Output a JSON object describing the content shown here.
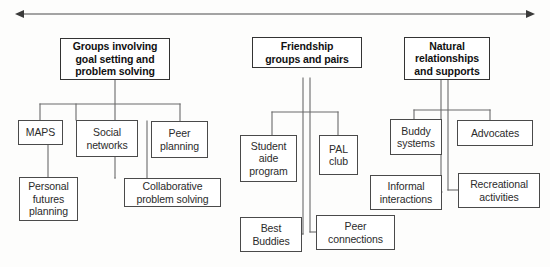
{
  "diagram": {
    "type": "hierarchy-chart",
    "title_arrow": {
      "name": "continuum-arrow",
      "direction": "double-headed",
      "description": "horizontal double-headed arrow spanning the top of the diagram"
    },
    "colors": {
      "background": "#fdfdfc",
      "box_border": "#4a4a4a",
      "heading_border": "#333333",
      "connector": "#6a6a6a",
      "text": "#1a1a1a"
    },
    "groups": [
      {
        "id": "group-goal-setting",
        "heading": "Groups involving\ngoal setting and\nproblem solving",
        "children": [
          {
            "id": "maps",
            "label": "MAPS"
          },
          {
            "id": "social-networks",
            "label": "Social\nnetworks"
          },
          {
            "id": "peer-planning",
            "label": "Peer\nplanning"
          },
          {
            "id": "personal-futures-planning",
            "label": "Personal\nfutures\nplanning"
          },
          {
            "id": "collaborative-problem-solving",
            "label": "Collaborative\nproblem solving"
          }
        ]
      },
      {
        "id": "group-friendship",
        "heading": "Friendship\ngroups and pairs",
        "children": [
          {
            "id": "student-aide-program",
            "label": "Student\naide\nprogram"
          },
          {
            "id": "pal-club",
            "label": "PAL\nclub"
          },
          {
            "id": "best-buddies",
            "label": "Best\nBuddies"
          },
          {
            "id": "peer-connections",
            "label": "Peer\nconnections"
          }
        ]
      },
      {
        "id": "group-natural-relationships",
        "heading": "Natural\nrelationships\nand supports",
        "children": [
          {
            "id": "buddy-systems",
            "label": "Buddy\nsystems"
          },
          {
            "id": "advocates",
            "label": "Advocates"
          },
          {
            "id": "informal-interactions",
            "label": "Informal\ninteractions"
          },
          {
            "id": "recreational-activities",
            "label": "Recreational\nactivities"
          }
        ]
      }
    ]
  }
}
